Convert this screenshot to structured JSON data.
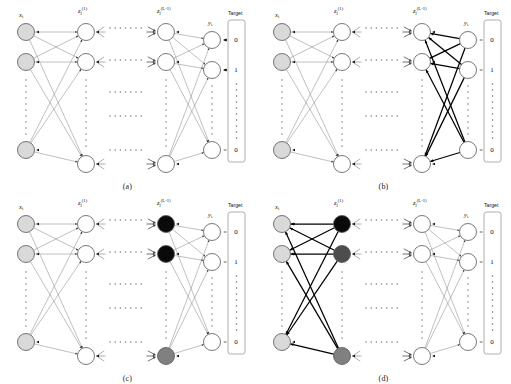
{
  "figure": {
    "width": 511,
    "height": 384,
    "background": "#ffffff"
  },
  "colors": {
    "node_stroke": "#555555",
    "node_fill_empty": "#ffffff",
    "node_fill_input": "#d9d9d9",
    "node_fill_black": "#0a0a0a",
    "node_fill_darkgray": "#4d4d4d",
    "node_fill_gray": "#808080",
    "edge_light": "#8c8c8c",
    "edge_bold": "#000000",
    "arrow_dark": "#111111",
    "arrow_light": "#9a9a9a",
    "target_box_stroke": "#9a9a9a",
    "dots": "#777777",
    "text": "#111111"
  },
  "labels": {
    "input": {
      "base": "x",
      "sub": "i"
    },
    "hidden1": {
      "base": "z",
      "sub": "j",
      "sup": "(1)"
    },
    "hiddenL1": {
      "base": "z",
      "sub": "j",
      "sup": "(L-1)"
    },
    "output": {
      "base": "y",
      "sub": "i"
    },
    "target_title": "Target"
  },
  "target": {
    "values": [
      "0",
      "1",
      "0"
    ],
    "ellipsis": "⋮"
  },
  "panels": [
    {
      "id": "a",
      "caption": "(a)",
      "description": "Forward propagation: all nodes unfilled except light gray inputs; thin gray edges flow left to right; dark arrows at top two outputs and light arrow at bottom output from target.",
      "input_fill": "node_fill_input",
      "hidden1_fills": [
        "node_fill_empty",
        "node_fill_empty",
        "node_fill_empty"
      ],
      "hiddenL1_fills": [
        "node_fill_empty",
        "node_fill_empty",
        "node_fill_empty"
      ],
      "output_fills": [
        "node_fill_empty",
        "node_fill_empty",
        "node_fill_empty"
      ],
      "bold_block": "none",
      "target_arrow_styles": [
        "dark",
        "dark",
        "light"
      ]
    },
    {
      "id": "b",
      "caption": "(b)",
      "description": "Backpropagation at output: bold black edges between output layer and layer L-1; all nodes unfilled.",
      "input_fill": "node_fill_input",
      "hidden1_fills": [
        "node_fill_empty",
        "node_fill_empty",
        "node_fill_empty"
      ],
      "hiddenL1_fills": [
        "node_fill_empty",
        "node_fill_empty",
        "node_fill_empty"
      ],
      "output_fills": [
        "node_fill_empty",
        "node_fill_empty",
        "node_fill_empty"
      ],
      "bold_block": "output-to-L1",
      "target_arrow_styles": [
        "light",
        "light",
        "light"
      ]
    },
    {
      "id": "c",
      "caption": "(c)",
      "description": "Layer L-1 neurons activated: top two nodes black, bottom node gray; thin edges elsewhere.",
      "input_fill": "node_fill_input",
      "hidden1_fills": [
        "node_fill_empty",
        "node_fill_empty",
        "node_fill_empty"
      ],
      "hiddenL1_fills": [
        "node_fill_black",
        "node_fill_black",
        "node_fill_gray"
      ],
      "output_fills": [
        "node_fill_empty",
        "node_fill_empty",
        "node_fill_empty"
      ],
      "bold_block": "none",
      "target_arrow_styles": [
        "light",
        "light",
        "light"
      ]
    },
    {
      "id": "d",
      "caption": "(d)",
      "description": "Backpropagation reaches first hidden layer: top node black, second dark gray, bottom gray; bold black edges from hidden layer 1 back to inputs.",
      "input_fill": "node_fill_input",
      "hidden1_fills": [
        "node_fill_black",
        "node_fill_darkgray",
        "node_fill_gray"
      ],
      "hiddenL1_fills": [
        "node_fill_empty",
        "node_fill_empty",
        "node_fill_empty"
      ],
      "output_fills": [
        "node_fill_empty",
        "node_fill_empty",
        "node_fill_empty"
      ],
      "bold_block": "hidden1-to-input",
      "target_arrow_styles": [
        "light",
        "light",
        "light"
      ]
    }
  ],
  "geometry": {
    "columns": {
      "input_x": 26,
      "hidden1_x": 86,
      "hiddenL1_x": 166,
      "output_x": 212
    },
    "rows": {
      "top_y": 32,
      "mid_y": 62,
      "bottom_y": 150
    },
    "node_radius": 8.5,
    "ellipsis_columns_x": [
      126
    ],
    "ellipsis_rows_y": [
      28,
      60,
      92,
      116,
      150
    ]
  }
}
